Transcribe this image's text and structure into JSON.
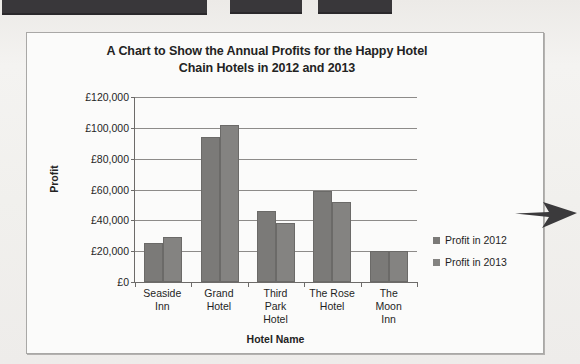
{
  "page": {
    "redactions": [
      {
        "name": "redaction-bar-1"
      },
      {
        "name": "redaction-bar-2"
      },
      {
        "name": "redaction-bar-3"
      }
    ],
    "annotation": {
      "name": "arrow-annotation",
      "direction": "left",
      "color": "#3a3a3a"
    }
  },
  "chart_data": {
    "type": "bar",
    "title": "A Chart to Show the Annual Profits for the Happy Hotel Chain Hotels in 2012 and 2013",
    "title_line_1": "A Chart to Show the Annual Profits for the Happy Hotel",
    "title_line_2": "Chain Hotels in 2012 and 2013",
    "xlabel": "Hotel Name",
    "ylabel": "Profit",
    "categories": [
      "Seaside Inn",
      "Grand Hotel",
      "Third Park Hotel",
      "The Rose Hotel",
      "The Moon Inn"
    ],
    "category_lines": [
      [
        "Seaside",
        "Inn"
      ],
      [
        "Grand",
        "Hotel"
      ],
      [
        "Third",
        "Park",
        "Hotel"
      ],
      [
        "The Rose",
        "Hotel"
      ],
      [
        "The",
        "Moon",
        "Inn"
      ]
    ],
    "series": [
      {
        "name": "Profit in 2012",
        "color": "#7b7a78",
        "values": [
          25000,
          94000,
          46000,
          59000,
          20000
        ]
      },
      {
        "name": "Profit in 2013",
        "color": "#848381",
        "values": [
          29000,
          102000,
          38000,
          52000,
          20000
        ]
      }
    ],
    "ylim": [
      0,
      120000
    ],
    "ytick_values": [
      0,
      20000,
      40000,
      60000,
      80000,
      100000,
      120000
    ],
    "ytick_labels": [
      "£120,000",
      "£100,000",
      "£80,000",
      "£60,000",
      "£40,000",
      "£20,000",
      "£0"
    ],
    "grid": true,
    "legend_position": "right",
    "currency_symbol": "£"
  }
}
